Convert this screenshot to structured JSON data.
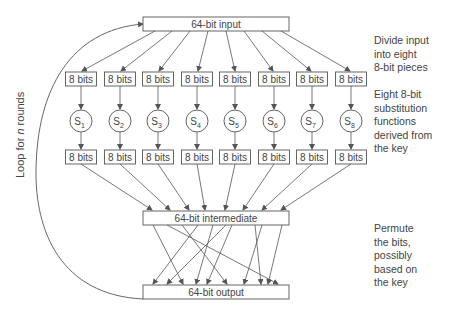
{
  "diagram": {
    "input_box": "64-bit input",
    "intermediate_box": "64-bit intermediate",
    "output_box": "64-bit output",
    "piece_label": "8 bits",
    "sboxes": [
      {
        "name": "S",
        "sub": "1"
      },
      {
        "name": "S",
        "sub": "2"
      },
      {
        "name": "S",
        "sub": "3"
      },
      {
        "name": "S",
        "sub": "4"
      },
      {
        "name": "S",
        "sub": "5"
      },
      {
        "name": "S",
        "sub": "6"
      },
      {
        "name": "S",
        "sub": "7"
      },
      {
        "name": "S",
        "sub": "8"
      }
    ],
    "loop_label": {
      "prefix": "Loop for ",
      "var": "n",
      "suffix": " rounds"
    }
  },
  "annotations": {
    "divide": [
      "Divide input",
      "into eight",
      "8-bit pieces"
    ],
    "substitute": [
      "Eight 8-bit",
      "substitution",
      "functions",
      "derived from",
      "the key"
    ],
    "permute": [
      "Permute",
      "the bits,",
      "possibly",
      "based on",
      "the key"
    ]
  },
  "colors": {
    "line": "#555555",
    "text": "#444444",
    "background": "#ffffff"
  }
}
